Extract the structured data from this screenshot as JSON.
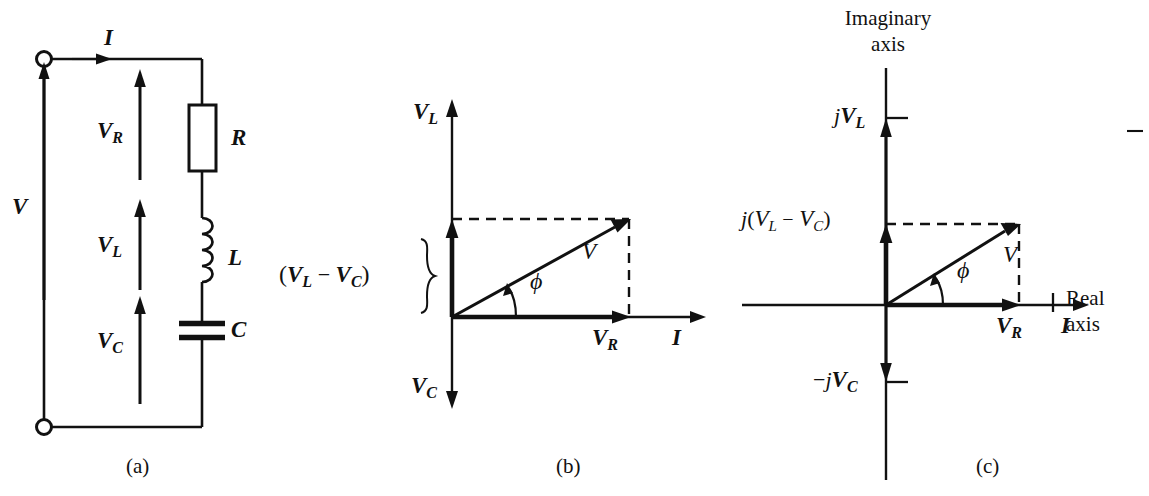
{
  "figure": {
    "kind": "three-panel electrical engineering figure",
    "background_color": "#ffffff",
    "ink_color": "#111111",
    "captions": [
      {
        "id": "a",
        "text": "(a)"
      },
      {
        "id": "b",
        "text": "(b)"
      },
      {
        "id": "c",
        "text": "(c)"
      }
    ]
  },
  "panel_a": {
    "caption": "(a)",
    "title": "series RLC circuit",
    "source_label": {
      "base": "V",
      "sub": ""
    },
    "current_label": {
      "base": "I",
      "sub": ""
    },
    "voltage_labels": [
      {
        "base": "V",
        "sub": "R"
      },
      {
        "base": "V",
        "sub": "L"
      },
      {
        "base": "V",
        "sub": "C"
      }
    ],
    "component_labels": [
      {
        "base": "R",
        "sub": "",
        "name": "resistor"
      },
      {
        "base": "L",
        "sub": "",
        "name": "inductor"
      },
      {
        "base": "C",
        "sub": "",
        "name": "capacitor"
      }
    ],
    "terminals": 2
  },
  "panel_b": {
    "caption": "(b)",
    "title": "phasor diagram",
    "vertical_axis_top_label": {
      "base": "V",
      "sub": "L"
    },
    "vertical_axis_bottom_label": {
      "base": "V",
      "sub": "C"
    },
    "horizontal_axis_label": {
      "base": "I",
      "sub": ""
    },
    "resistive_label": {
      "base": "V",
      "sub": "R"
    },
    "resultant_label": {
      "base": "V",
      "sub": ""
    },
    "angle_label": "ϕ",
    "brace_label": {
      "open": "(",
      "first": {
        "base": "V",
        "sub": "L"
      },
      "operator": "−",
      "second": {
        "base": "V",
        "sub": "C"
      },
      "close": ")"
    }
  },
  "panel_c": {
    "caption": "(c)",
    "title": "complex plane representation",
    "imaginary_axis_label": "Imaginary\naxis",
    "imaginary_axis_label_line1": "Imaginary",
    "imaginary_axis_label_line2": "axis",
    "real_axis_label_line1": "Real",
    "real_axis_label_line2": "axis",
    "tick_labels": [
      {
        "id": "jvl",
        "prefix": "j",
        "base": "V",
        "sub": "L",
        "sign": ""
      },
      {
        "id": "njvc",
        "prefix": "j",
        "base": "V",
        "sub": "C",
        "sign": "−"
      }
    ],
    "difference_label": {
      "prefix": "j",
      "open": "(",
      "first": {
        "base": "V",
        "sub": "L"
      },
      "operator": "−",
      "second": {
        "base": "V",
        "sub": "C"
      },
      "close": ")"
    },
    "resistive_label": {
      "base": "V",
      "sub": "R"
    },
    "current_label": {
      "base": "I",
      "sub": ""
    },
    "resultant_label": {
      "base": "V",
      "sub": ""
    },
    "angle_label": "ϕ"
  }
}
